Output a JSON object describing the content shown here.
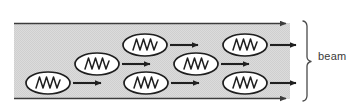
{
  "figure": {
    "annotation": {
      "label": "beam",
      "bracket": "right-vertical-brace"
    },
    "beam_band": {
      "x": 14,
      "y": 22,
      "width": 276,
      "height": 78,
      "fill_color": "#d9d9d9",
      "edge_color": "#3c3c3c",
      "texture": "fine-dither"
    },
    "boundary_arrows": [
      {
        "name": "top-boundary-arrow",
        "y": 23,
        "x_start": 14,
        "x_end": 292,
        "direction": "right"
      },
      {
        "name": "bottom-boundary-arrow",
        "y": 99,
        "x_start": 14,
        "x_end": 292,
        "direction": "right"
      }
    ],
    "molecules": [
      {
        "id": 1,
        "row": "top",
        "cx": 145,
        "cy": 45,
        "rx": 22,
        "ry": 11,
        "arrow_length": 31,
        "symbol": "zigzag-oscillator"
      },
      {
        "id": 2,
        "row": "top",
        "cx": 245,
        "cy": 45,
        "rx": 22,
        "ry": 11,
        "arrow_length": 31,
        "symbol": "zigzag-oscillator"
      },
      {
        "id": 3,
        "row": "middle",
        "cx": 97,
        "cy": 64,
        "rx": 22,
        "ry": 11,
        "arrow_length": 31,
        "symbol": "zigzag-oscillator"
      },
      {
        "id": 4,
        "row": "middle",
        "cx": 196,
        "cy": 64,
        "rx": 22,
        "ry": 11,
        "arrow_length": 31,
        "symbol": "zigzag-oscillator"
      },
      {
        "id": 5,
        "row": "bottom",
        "cx": 48,
        "cy": 83,
        "rx": 22,
        "ry": 11,
        "arrow_length": 31,
        "symbol": "zigzag-oscillator"
      },
      {
        "id": 6,
        "row": "bottom",
        "cx": 146,
        "cy": 83,
        "rx": 22,
        "ry": 11,
        "arrow_length": 31,
        "symbol": "zigzag-oscillator"
      },
      {
        "id": 7,
        "row": "bottom",
        "cx": 245,
        "cy": 83,
        "rx": 22,
        "ry": 11,
        "arrow_length": 31,
        "symbol": "zigzag-oscillator"
      }
    ],
    "colors": {
      "background": "#ffffff",
      "band_fill": "#d9d9d9",
      "stroke": "#2b2b2b",
      "molecule_fill": "#ffffff",
      "label_text": "#3a3a3a"
    },
    "counts": {
      "molecules_total": 7,
      "top_row": 2,
      "middle_row": 2,
      "bottom_row": 3
    }
  }
}
